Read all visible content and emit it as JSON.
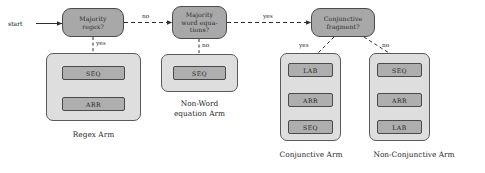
{
  "diagram": {
    "start_label": "start",
    "colors": {
      "decision_fill": "#a8a8a8",
      "arm_fill": "#dedede",
      "op_fill": "#aeaeae",
      "stroke": "#4a4a4a",
      "text": "#232323",
      "background": "#ffffff"
    },
    "decisions": [
      {
        "id": "majority-regex",
        "text": "Majority\nregex?"
      },
      {
        "id": "majority-word-equations",
        "text": "Majority\nword equa-\ntions?"
      },
      {
        "id": "conjunctive-fragment",
        "text": "Conjunctive\nfragment?"
      }
    ],
    "edge_labels": {
      "regex_to_wordeq": "no",
      "wordeq_to_conjunctive": "yes",
      "regex_yes": "yes",
      "wordeq_no": "no",
      "conjunctive_yes": "yes",
      "conjunctive_no": "no"
    },
    "arms": [
      {
        "id": "regex-arm",
        "caption": "Regex Arm",
        "steps": [
          "SEQ",
          "ARR"
        ]
      },
      {
        "id": "non-word-equation-arm",
        "caption": "Non-Word\nequation Arm",
        "steps": [
          "SEQ"
        ]
      },
      {
        "id": "conjunctive-arm",
        "caption": "Conjunctive Arm",
        "steps": [
          "LAB",
          "ARR",
          "SEQ"
        ]
      },
      {
        "id": "non-conjunctive-arm",
        "caption": "Non-Conjunctive Arm",
        "steps": [
          "SEQ",
          "ARR",
          "LAB"
        ]
      }
    ]
  }
}
